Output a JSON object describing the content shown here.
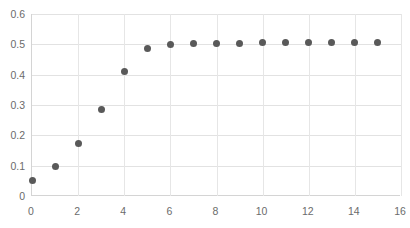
{
  "chart_data": {
    "type": "scatter",
    "title": "",
    "subtitle": "",
    "xlabel": "",
    "ylabel": "",
    "xlim": [
      0,
      16
    ],
    "ylim": [
      0,
      0.6
    ],
    "grid": true,
    "legend": null,
    "legend_position": "none",
    "marker_color": "#595959",
    "gridline_color": "#e2e2e2",
    "axis_color": "#d4d4d4",
    "tick_label_color": "#6b6b6b",
    "background_color": "#ffffff",
    "x_ticks": [
      0,
      2,
      4,
      6,
      8,
      10,
      12,
      14,
      16
    ],
    "x_tick_labels": [
      "0",
      "2",
      "4",
      "6",
      "8",
      "10",
      "12",
      "14",
      "16"
    ],
    "y_ticks": [
      0,
      0.1,
      0.2,
      0.3,
      0.4,
      0.5,
      0.6
    ],
    "y_tick_labels": [
      "0",
      "0.1",
      "0.2",
      "0.3",
      "0.4",
      "0.5",
      "0.6"
    ],
    "x": [
      0,
      1,
      2,
      3,
      4,
      5,
      6,
      7,
      8,
      9,
      10,
      11,
      12,
      13,
      14,
      15
    ],
    "values": [
      0.05,
      0.097,
      0.172,
      0.285,
      0.409,
      0.485,
      0.501,
      0.503,
      0.504,
      0.504,
      0.505,
      0.505,
      0.506,
      0.506,
      0.506,
      0.506
    ]
  }
}
